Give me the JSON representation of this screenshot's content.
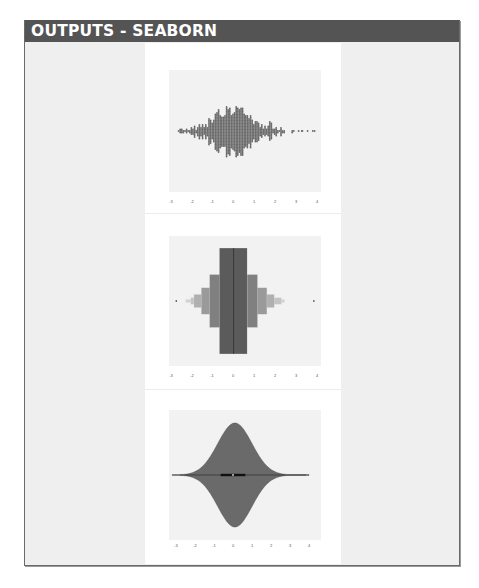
{
  "header": {
    "title": "OUTPUTS - SEABORN"
  },
  "colors": {
    "header_bg": "#545454",
    "frame_bg": "#efefef",
    "axes_bg": "#eaeaf2",
    "swarm_dot": "#6a6a6a",
    "boxen_shades": [
      "#5b5b5b",
      "#808080",
      "#9a9a9a",
      "#b0b0b0",
      "#c4c4c4",
      "#d2d2d2"
    ],
    "violin_fill": "#6a6a6a"
  },
  "chart_data": [
    {
      "type": "scatter",
      "kind": "swarmplot",
      "title": "",
      "xlabel": "",
      "ylabel": "",
      "x_ticks": [
        "-3",
        "-2",
        "-1",
        "0",
        "1",
        "2",
        "3",
        "4"
      ],
      "xlim": [
        -3.1,
        4.1
      ],
      "grid": false,
      "distribution": "approximately standard normal, ~1000 points, centered near 0, range about -2.6 to 3.8"
    },
    {
      "type": "bar",
      "kind": "boxenplot",
      "title": "",
      "xlabel": "",
      "ylabel": "",
      "x_ticks": [
        "-3",
        "-2",
        "-1",
        "0",
        "1",
        "2",
        "3",
        "4"
      ],
      "xlim": [
        -3.1,
        4.1
      ],
      "median": 0.0,
      "boxes": [
        {
          "level": 1,
          "low": -0.68,
          "high": 0.65,
          "height_frac": 1.0
        },
        {
          "level": 2,
          "low": -1.15,
          "high": 1.15,
          "height_frac": 0.5
        },
        {
          "level": 3,
          "low": -1.55,
          "high": 1.6,
          "height_frac": 0.25
        },
        {
          "level": 4,
          "low": -1.9,
          "high": 1.95,
          "height_frac": 0.125
        },
        {
          "level": 5,
          "low": -2.05,
          "high": 2.3,
          "height_frac": 0.0625
        },
        {
          "level": 6,
          "low": -2.3,
          "high": 2.45,
          "height_frac": 0.03
        }
      ],
      "outliers": [
        -2.75,
        3.85
      ]
    },
    {
      "type": "area",
      "kind": "violinplot",
      "title": "",
      "xlabel": "",
      "ylabel": "",
      "x_ticks": [
        "-3",
        "-2",
        "-1",
        "0",
        "1",
        "2",
        "3",
        "4"
      ],
      "xlim": [
        -3.1,
        4.1
      ],
      "kde_peak_x": 0.1,
      "inner_box": {
        "q1": -0.65,
        "median": 0.0,
        "q3": 0.65
      },
      "whisker_range": [
        -2.8,
        3.85
      ]
    }
  ]
}
